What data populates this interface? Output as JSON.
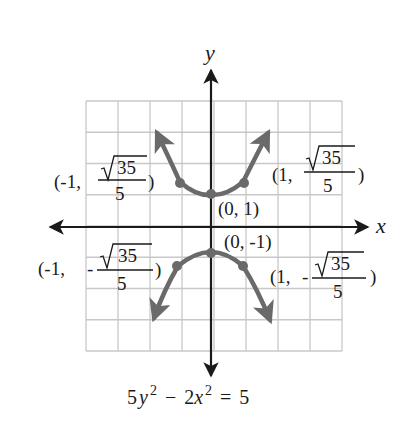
{
  "figure": {
    "x_axis_label": "x",
    "y_axis_label": "y",
    "equation": {
      "coef_y": "5",
      "var_y": "y",
      "exp_y": "2",
      "minus": "−",
      "coef_x": "2",
      "var_x": "x",
      "exp_x": "2",
      "equals": "=",
      "rhs": "5",
      "full_text": "5y² − 2x² = 5"
    },
    "colors": {
      "grid": "#c8c8c8",
      "axis": "#1a1a1a",
      "curve": "#6a6a6a",
      "text": "#1a1a1a"
    },
    "grid": {
      "columns": 8,
      "rows": 8
    },
    "points": [
      {
        "id": "vertex-top",
        "label": "(0, 1)",
        "x": 0,
        "y": 1
      },
      {
        "id": "vertex-bottom",
        "label": "(0, -1)",
        "x": 0,
        "y": -1
      },
      {
        "id": "upper-left",
        "prefix": "(-1, ",
        "sign": "",
        "num": "35",
        "den": "5",
        "suffix": ")",
        "x": -1,
        "y": "√35/5"
      },
      {
        "id": "upper-right",
        "prefix": "(1, ",
        "sign": "",
        "num": "35",
        "den": "5",
        "suffix": ")",
        "x": 1,
        "y": "√35/5"
      },
      {
        "id": "lower-left",
        "prefix": "(-1, ",
        "sign": "-",
        "num": "35",
        "den": "5",
        "suffix": ")",
        "x": -1,
        "y": "-√35/5"
      },
      {
        "id": "lower-right",
        "prefix": "(1, ",
        "sign": "-",
        "num": "35",
        "den": "5",
        "suffix": ")",
        "x": 1,
        "y": "-√35/5"
      }
    ]
  }
}
